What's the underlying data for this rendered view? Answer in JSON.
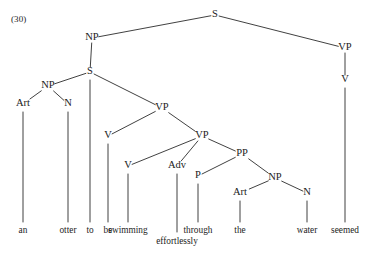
{
  "figure": {
    "example_number": "(30)",
    "width": 369,
    "height": 255,
    "background": "#ffffff",
    "ink_color": "#2b2b2b",
    "text_color": "#1a1a1a"
  },
  "sentence": "an otter to be swimming effortlessly through the water seemed",
  "tree": {
    "nodes": [
      {
        "id": "S_top",
        "label": "S",
        "x": 215,
        "y": 15
      },
      {
        "id": "NP_subj",
        "label": "NP",
        "x": 92,
        "y": 38
      },
      {
        "id": "VP_matrix",
        "label": "VP",
        "x": 345,
        "y": 48
      },
      {
        "id": "S_embed",
        "label": "S",
        "x": 90,
        "y": 72
      },
      {
        "id": "V_matrix",
        "label": "V",
        "x": 345,
        "y": 80
      },
      {
        "id": "NP_inner",
        "label": "NP",
        "x": 48,
        "y": 86
      },
      {
        "id": "Art_an",
        "label": "Art",
        "x": 23,
        "y": 104
      },
      {
        "id": "N_otter",
        "label": "N",
        "x": 68,
        "y": 104
      },
      {
        "id": "VP_outer",
        "label": "VP",
        "x": 162,
        "y": 108
      },
      {
        "id": "V_be",
        "label": "V",
        "x": 108,
        "y": 136
      },
      {
        "id": "VP_inner",
        "label": "VP",
        "x": 202,
        "y": 136
      },
      {
        "id": "PP",
        "label": "PP",
        "x": 242,
        "y": 154
      },
      {
        "id": "V_swim",
        "label": "V",
        "x": 128,
        "y": 166
      },
      {
        "id": "Adv",
        "label": "Adv",
        "x": 177,
        "y": 166
      },
      {
        "id": "P_through",
        "label": "P",
        "x": 198,
        "y": 176
      },
      {
        "id": "NP_water",
        "label": "NP",
        "x": 275,
        "y": 178
      },
      {
        "id": "Art_the",
        "label": "Art",
        "x": 240,
        "y": 193
      },
      {
        "id": "N_water",
        "label": "N",
        "x": 307,
        "y": 193
      }
    ],
    "edges": [
      {
        "from": "S_top",
        "to": "NP_subj"
      },
      {
        "from": "S_top",
        "to": "VP_matrix"
      },
      {
        "from": "NP_subj",
        "to": "S_embed"
      },
      {
        "from": "VP_matrix",
        "to": "V_matrix"
      },
      {
        "from": "S_embed",
        "to": "NP_inner"
      },
      {
        "from": "S_embed",
        "to": "VP_outer"
      },
      {
        "from": "NP_inner",
        "to": "Art_an"
      },
      {
        "from": "NP_inner",
        "to": "N_otter"
      },
      {
        "from": "VP_outer",
        "to": "V_be"
      },
      {
        "from": "VP_outer",
        "to": "VP_inner"
      },
      {
        "from": "VP_inner",
        "to": "V_swim"
      },
      {
        "from": "VP_inner",
        "to": "Adv"
      },
      {
        "from": "VP_inner",
        "to": "PP"
      },
      {
        "from": "PP",
        "to": "P_through"
      },
      {
        "from": "PP",
        "to": "NP_water"
      },
      {
        "from": "NP_water",
        "to": "Art_the"
      },
      {
        "from": "NP_water",
        "to": "N_water"
      }
    ],
    "leaves": [
      {
        "id": "leaf_an",
        "word": "an",
        "parent": "Art_an",
        "x": 23,
        "stem_top": 112,
        "stem_bottom": 222,
        "word_y": 231
      },
      {
        "id": "leaf_otter",
        "word": "otter",
        "parent": "N_otter",
        "x": 68,
        "stem_top": 112,
        "stem_bottom": 222,
        "word_y": 231
      },
      {
        "id": "leaf_to",
        "word": "to",
        "parent": "S_embed",
        "x": 90,
        "stem_top": 80,
        "stem_bottom": 222,
        "word_y": 231
      },
      {
        "id": "leaf_be",
        "word": "be",
        "parent": "V_be",
        "x": 108,
        "stem_top": 144,
        "stem_bottom": 222,
        "word_y": 231
      },
      {
        "id": "leaf_swimming",
        "word": "swimming",
        "parent": "V_swim",
        "x": 128,
        "stem_top": 174,
        "stem_bottom": 222,
        "word_y": 231
      },
      {
        "id": "leaf_effortlessly",
        "word": "effortlessly",
        "parent": "Adv",
        "x": 177,
        "stem_top": 174,
        "stem_bottom": 232,
        "word_y": 242
      },
      {
        "id": "leaf_through",
        "word": "through",
        "parent": "P_through",
        "x": 198,
        "stem_top": 184,
        "stem_bottom": 222,
        "word_y": 231
      },
      {
        "id": "leaf_the",
        "word": "the",
        "parent": "Art_the",
        "x": 240,
        "stem_top": 201,
        "stem_bottom": 222,
        "word_y": 231
      },
      {
        "id": "leaf_water",
        "word": "water",
        "parent": "N_water",
        "x": 307,
        "stem_top": 201,
        "stem_bottom": 222,
        "word_y": 231
      },
      {
        "id": "leaf_seemed",
        "word": "seemed",
        "parent": "V_matrix",
        "x": 345,
        "stem_top": 88,
        "stem_bottom": 222,
        "word_y": 231
      }
    ]
  }
}
